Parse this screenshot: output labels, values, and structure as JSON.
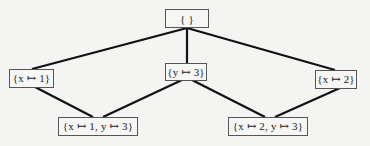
{
  "diagram": {
    "type": "lattice",
    "nodes": [
      {
        "id": "top",
        "label": "{ }"
      },
      {
        "id": "x1",
        "label": "{x ↦ 1}"
      },
      {
        "id": "y3",
        "label": "{y ↦ 3}"
      },
      {
        "id": "x2",
        "label": "{x ↦ 2}"
      },
      {
        "id": "x1y3",
        "label": "{x ↦ 1, y ↦ 3}"
      },
      {
        "id": "x2y3",
        "label": "{x ↦ 2, y ↦ 3}"
      }
    ],
    "edges": [
      {
        "from": "top",
        "to": "x1"
      },
      {
        "from": "top",
        "to": "y3"
      },
      {
        "from": "top",
        "to": "x2"
      },
      {
        "from": "x1",
        "to": "x1y3"
      },
      {
        "from": "y3",
        "to": "x1y3"
      },
      {
        "from": "y3",
        "to": "x2y3"
      },
      {
        "from": "x2",
        "to": "x2y3"
      }
    ],
    "colors": {
      "line": "#111111",
      "box_border": "#555555",
      "background": "#f4f4f2"
    }
  }
}
